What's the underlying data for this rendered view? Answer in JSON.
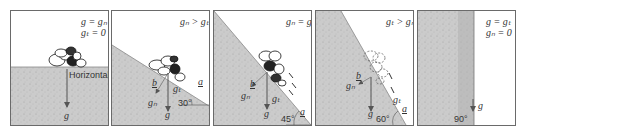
{
  "figure": {
    "panels": [
      {
        "id": "horizontal",
        "equations": [
          "g = gₙ",
          "gₜ = 0"
        ],
        "surface_label": "Horizontal",
        "vector_labels": {
          "g": "g"
        },
        "slope_angle": "0°"
      },
      {
        "id": "slope-30",
        "equations": [
          "gₙ > gₜ"
        ],
        "angle": "30°",
        "angle_labels": {
          "a": "a",
          "b": "b"
        },
        "vector_labels": {
          "g": "g",
          "gn": "gₙ",
          "gt": "gₜ"
        }
      },
      {
        "id": "slope-45",
        "equations": [
          "gₙ = gₜ"
        ],
        "angle": "45°",
        "angle_labels": {
          "a": "a",
          "b": "b"
        },
        "vector_labels": {
          "g": "g",
          "gn": "gₙ",
          "gt": "gₜ"
        }
      },
      {
        "id": "slope-60",
        "equations": [
          "gₜ > gₙ"
        ],
        "angle": "60°",
        "angle_labels": {
          "a": "a",
          "b": "b"
        },
        "vector_labels": {
          "g": "g",
          "gn": "gₙ",
          "gt": "gₜ"
        }
      },
      {
        "id": "vertical",
        "equations": [
          "g = gₜ",
          "gₙ = 0"
        ],
        "angle": "90°",
        "vector_labels": {
          "g": "g"
        }
      }
    ],
    "colors": {
      "ground": "#c9c9c9",
      "ground_dark": "#8a8a8a",
      "border": "#6a6a6a",
      "arrow": "#555555",
      "text": "#333333"
    }
  }
}
